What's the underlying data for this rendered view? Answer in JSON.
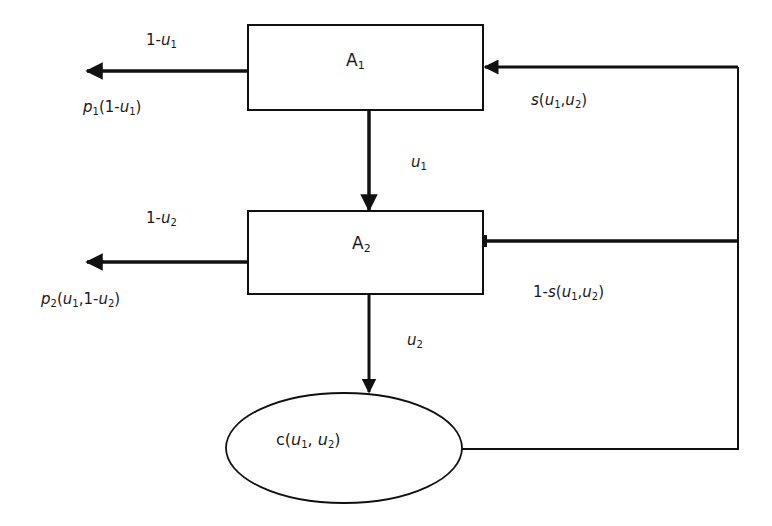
{
  "diagram": {
    "nodes": {
      "a1": {
        "base": "A",
        "sub": "1"
      },
      "a2": {
        "base": "A",
        "sub": "2"
      },
      "c": {
        "prefix": "c(",
        "v1": "u",
        "s1": "1",
        "sep": ", ",
        "v2": "u",
        "s2": "2",
        "suffix": ")"
      }
    },
    "edges": {
      "a1_out_top": {
        "pre": "1-",
        "var": "u",
        "sub": "1"
      },
      "a1_out_bottom": {
        "fn": "p",
        "fsub": "1",
        "open": "(1-",
        "var": "u",
        "vsub": "1",
        "close": ")"
      },
      "a1_to_a2": {
        "var": "u",
        "sub": "1"
      },
      "feedback_a1": {
        "fn": "s",
        "open": "(",
        "v1": "u",
        "s1": "1",
        "sep": ",",
        "v2": "u",
        "s2": "2",
        "close": ")"
      },
      "a2_out_top": {
        "pre": "1-",
        "var": "u",
        "sub": "2"
      },
      "a2_out_bottom": {
        "fn": "p",
        "fsub": "2",
        "open": "(",
        "v1": "u",
        "s1": "1",
        "mid": ",1-",
        "v2": "u",
        "s2": "2",
        "close": ")"
      },
      "feedback_a2": {
        "pre": "1-",
        "fn": "s",
        "open": "(",
        "v1": "u",
        "s1": "1",
        "sep": ",",
        "v2": "u",
        "s2": "2",
        "close": ")"
      },
      "a2_to_c": {
        "var": "u",
        "sub": "2"
      }
    },
    "colors": {
      "line": "#111111",
      "background": "#ffffff"
    }
  }
}
